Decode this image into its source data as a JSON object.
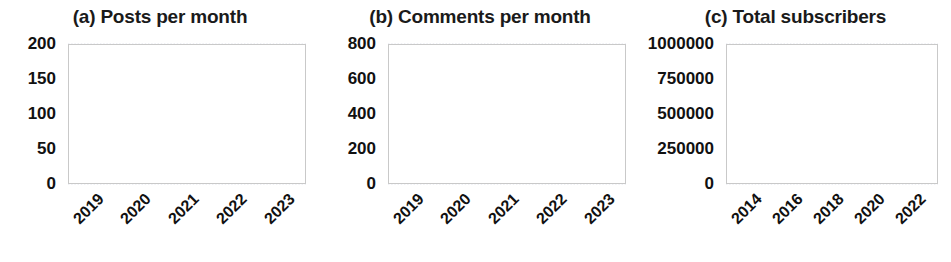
{
  "figure": {
    "background": "#ffffff",
    "line_color": "#7e7e7e",
    "grid_color": "#d8dce8",
    "frame_color": "#c9c9c9"
  },
  "panels": [
    {
      "key": "a",
      "title": "(a) Posts per month",
      "yticks": [
        "0",
        "50",
        "100",
        "150",
        "200"
      ],
      "xticks": [
        "2019",
        "2020",
        "2021",
        "2022",
        "2023"
      ]
    },
    {
      "key": "b",
      "title": "(b) Comments per month",
      "yticks": [
        "0",
        "200",
        "400",
        "600",
        "800"
      ],
      "xticks": [
        "2019",
        "2020",
        "2021",
        "2022",
        "2023"
      ]
    },
    {
      "key": "c",
      "title": "(c) Total subscribers",
      "yticks": [
        "0",
        "250000",
        "500000",
        "750000",
        "1000000"
      ],
      "xticks": [
        "2014",
        "2016",
        "2018",
        "2020",
        "2022"
      ]
    }
  ],
  "chart_data": [
    {
      "type": "line",
      "title": "(a) Posts per month",
      "xlabel": "",
      "ylabel": "",
      "ylim": [
        0,
        200
      ],
      "yticks": [
        0,
        50,
        100,
        150,
        200
      ],
      "xlim": [
        "2018-09",
        "2023-06"
      ],
      "xticks": [
        "2019",
        "2020",
        "2021",
        "2022",
        "2023"
      ],
      "grid": true,
      "legend": "none",
      "series": [
        {
          "name": "posts per month",
          "x": [
            "2018-09",
            "2018-10",
            "2018-11",
            "2018-12",
            "2019-01",
            "2019-02",
            "2019-03",
            "2019-04",
            "2019-05",
            "2019-06",
            "2019-07",
            "2019-08",
            "2019-09",
            "2019-10",
            "2019-11",
            "2019-12",
            "2020-01",
            "2020-02",
            "2020-03",
            "2020-04",
            "2020-05",
            "2020-06",
            "2020-07",
            "2020-08",
            "2020-09",
            "2020-10",
            "2020-11",
            "2020-12",
            "2021-01",
            "2021-02",
            "2021-03",
            "2021-04",
            "2021-05",
            "2021-06",
            "2021-07",
            "2021-08",
            "2021-09",
            "2021-10",
            "2021-11",
            "2021-12",
            "2022-01",
            "2022-02",
            "2022-03",
            "2022-04",
            "2022-05",
            "2022-06",
            "2022-07",
            "2022-08",
            "2022-09",
            "2022-10",
            "2022-11",
            "2022-12",
            "2023-01",
            "2023-02",
            "2023-03",
            "2023-04",
            "2023-05"
          ],
          "values": [
            51,
            54,
            58,
            63,
            70,
            77,
            72,
            67,
            66,
            66,
            69,
            72,
            72,
            71,
            70,
            68,
            73,
            71,
            71,
            76,
            73,
            151,
            148,
            104,
            94,
            88,
            83,
            81,
            79,
            79,
            80,
            78,
            76,
            76,
            78,
            79,
            77,
            74,
            73,
            72,
            71,
            69,
            88,
            75,
            76,
            72,
            75,
            71,
            64,
            67,
            63,
            61,
            58,
            56,
            58,
            55,
            53
          ]
        }
      ]
    },
    {
      "type": "line",
      "title": "(b) Comments per month",
      "xlabel": "",
      "ylabel": "",
      "ylim": [
        0,
        800
      ],
      "yticks": [
        0,
        200,
        400,
        600,
        800
      ],
      "xlim": [
        "2018-09",
        "2023-06"
      ],
      "xticks": [
        "2019",
        "2020",
        "2021",
        "2022",
        "2023"
      ],
      "grid": true,
      "legend": "none",
      "series": [
        {
          "name": "comments per month",
          "x": [
            "2018-09",
            "2018-10",
            "2018-11",
            "2018-12",
            "2019-01",
            "2019-02",
            "2019-03",
            "2019-04",
            "2019-05",
            "2019-06",
            "2019-07",
            "2019-08",
            "2019-09",
            "2019-10",
            "2019-11",
            "2019-12",
            "2020-01",
            "2020-02",
            "2020-03",
            "2020-04",
            "2020-05",
            "2020-06",
            "2020-07",
            "2020-08",
            "2020-09",
            "2020-10",
            "2020-11",
            "2020-12",
            "2021-01",
            "2021-02",
            "2021-03",
            "2021-04",
            "2021-05",
            "2021-06",
            "2021-07",
            "2021-08",
            "2021-09",
            "2021-10",
            "2021-11",
            "2021-12",
            "2022-01",
            "2022-02",
            "2022-03",
            "2022-04",
            "2022-05",
            "2022-06",
            "2022-07",
            "2022-08",
            "2022-09",
            "2022-10",
            "2022-11",
            "2022-12",
            "2023-01",
            "2023-02",
            "2023-03",
            "2023-04",
            "2023-05"
          ],
          "values": [
            232,
            262,
            245,
            281,
            254,
            288,
            255,
            252,
            255,
            244,
            222,
            208,
            190,
            182,
            190,
            200,
            250,
            262,
            254,
            670,
            440,
            330,
            490,
            345,
            330,
            370,
            365,
            360,
            355,
            375,
            385,
            380,
            370,
            330,
            300,
            260,
            265,
            230,
            215,
            250,
            270,
            250,
            265,
            310,
            255,
            290,
            250,
            260,
            230,
            200,
            190,
            185,
            180,
            180,
            178,
            175,
            195
          ]
        }
      ]
    },
    {
      "type": "line",
      "title": "(c) Total subscribers",
      "xlabel": "",
      "ylabel": "",
      "ylim": [
        0,
        1000000
      ],
      "yticks": [
        0,
        250000,
        500000,
        750000,
        1000000
      ],
      "xlim": [
        "2013",
        "2023.4"
      ],
      "xticks": [
        "2014",
        "2016",
        "2018",
        "2020",
        "2022"
      ],
      "grid": true,
      "legend": "none",
      "series": [
        {
          "name": "total subscribers",
          "x": [
            "2013.0",
            "2013.5",
            "2014.0",
            "2014.5",
            "2015.0",
            "2015.5",
            "2016.0",
            "2016.5",
            "2017.0",
            "2017.5",
            "2018.0",
            "2018.5",
            "2019.0",
            "2019.5",
            "2020.0",
            "2020.5",
            "2021.0",
            "2021.5",
            "2022.0",
            "2022.3",
            "2022.6",
            "2022.9",
            "2023.1",
            "2023.3"
          ],
          "values": [
            12000,
            18000,
            26000,
            34000,
            42000,
            50000,
            58000,
            66000,
            74000,
            84000,
            95000,
            112000,
            135000,
            170000,
            215000,
            265000,
            320000,
            385000,
            455000,
            520000,
            640000,
            780000,
            880000,
            935000
          ]
        }
      ]
    }
  ]
}
